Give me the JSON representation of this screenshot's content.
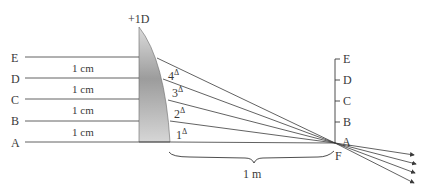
{
  "lens": {
    "power_label": "+1D"
  },
  "rays_left": {
    "labels": [
      "A",
      "B",
      "C",
      "D",
      "E"
    ],
    "spacing_labels": [
      "1 cm",
      "1 cm",
      "1 cm",
      "1 cm"
    ]
  },
  "prism_deviations": [
    {
      "value": "1",
      "unit": "Δ"
    },
    {
      "value": "2",
      "unit": "Δ"
    },
    {
      "value": "3",
      "unit": "Δ"
    },
    {
      "value": "4",
      "unit": "Δ"
    }
  ],
  "focal_plane": {
    "labels": [
      "A",
      "B",
      "C",
      "D",
      "E"
    ],
    "focal_point_label": "F"
  },
  "distance": {
    "label": "1 m"
  },
  "colors": {
    "line": "#3a3a3a",
    "lens_light": "#d2d2d2",
    "lens_dark": "#9a9a9a"
  }
}
